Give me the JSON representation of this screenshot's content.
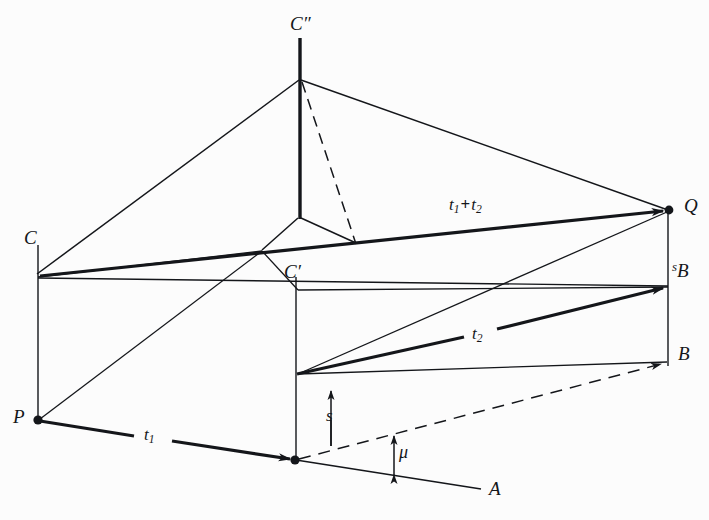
{
  "figure": {
    "kind": "3d-geometric-vector-diagram",
    "background_color": "#fcfcfc",
    "stroke_color": "#14161a",
    "width": 709,
    "height": 520,
    "points": {
      "C_doubleprime": {
        "x": 300,
        "y": 78,
        "label": "C″"
      },
      "C": {
        "x": 37,
        "y": 275,
        "label": "C"
      },
      "C_prime": {
        "x": 296,
        "y": 290,
        "label": "C′"
      },
      "Q": {
        "x": 669,
        "y": 210,
        "label": "Q"
      },
      "P": {
        "x": 38,
        "y": 420,
        "label": "P"
      },
      "foot": {
        "x": 295,
        "y": 460,
        "label": ""
      },
      "sB": {
        "x": 668,
        "y": 287,
        "label": "sB"
      },
      "B": {
        "x": 668,
        "y": 363,
        "label": "B"
      },
      "A": {
        "x": 481,
        "y": 489,
        "label": "A"
      }
    },
    "labels": [
      {
        "name": "label-C-doubleprime",
        "text": "C″",
        "x": 290,
        "y": 17,
        "kind": "point"
      },
      {
        "name": "label-C",
        "text": "C",
        "x": 27,
        "y": 231,
        "kind": "point"
      },
      {
        "name": "label-C-prime",
        "text": "C′",
        "x": 285,
        "y": 264,
        "kind": "point"
      },
      {
        "name": "label-Q",
        "text": "Q",
        "x": 684,
        "y": 198,
        "kind": "point"
      },
      {
        "name": "label-P",
        "text": "P",
        "x": 14,
        "y": 408,
        "kind": "point"
      },
      {
        "name": "label-A",
        "text": "A",
        "x": 489,
        "y": 481,
        "kind": "point"
      },
      {
        "name": "label-B",
        "text": "B",
        "x": 679,
        "y": 345,
        "kind": "point"
      },
      {
        "name": "label-sB",
        "text": "sB",
        "x": 673,
        "y": 264,
        "kind": "point-superscript"
      },
      {
        "name": "label-t1-plus-t2",
        "text": "t1 + t2",
        "x": 449,
        "y": 198,
        "kind": "vector-sum"
      },
      {
        "name": "label-t2",
        "text": "t2",
        "x": 474,
        "y": 327,
        "kind": "vector"
      },
      {
        "name": "label-t1",
        "text": "t1",
        "x": 145,
        "y": 428,
        "kind": "vector"
      },
      {
        "name": "label-s",
        "text": "s",
        "x": 327,
        "y": 408,
        "kind": "scalar"
      },
      {
        "name": "label-mu",
        "text": "μ",
        "x": 399,
        "y": 444,
        "kind": "angle"
      }
    ],
    "vectors": [
      {
        "name": "vector-t1",
        "label": "t1",
        "from": "P",
        "to": "foot",
        "style": "thick-arrow"
      },
      {
        "name": "vector-t2",
        "label": "t2",
        "from": "s-plane-start",
        "to": "sB",
        "style": "thick-arrow"
      },
      {
        "name": "vector-t1-plus-t2",
        "label": "t1 + t2",
        "from": "C",
        "to": "Q",
        "style": "thick-arrow"
      },
      {
        "name": "vector-foot-to-B",
        "label": "",
        "from": "foot",
        "to": "B",
        "style": "dashed-arrow"
      }
    ],
    "segments": {
      "solid_thin": "construction lines of the oblique box and pyramid",
      "solid_thick": "the vector arrows t1, t2, t1+t2 and the vertical axis C″–apex",
      "dashed": "hidden edges: C″ to interior apex, foot to B"
    },
    "text_glyphs": {
      "t": "t",
      "one": "1",
      "two": "2",
      "plus": "+",
      "s": "s",
      "mu": "μ",
      "prime": "′",
      "doubleprime": "″"
    }
  }
}
